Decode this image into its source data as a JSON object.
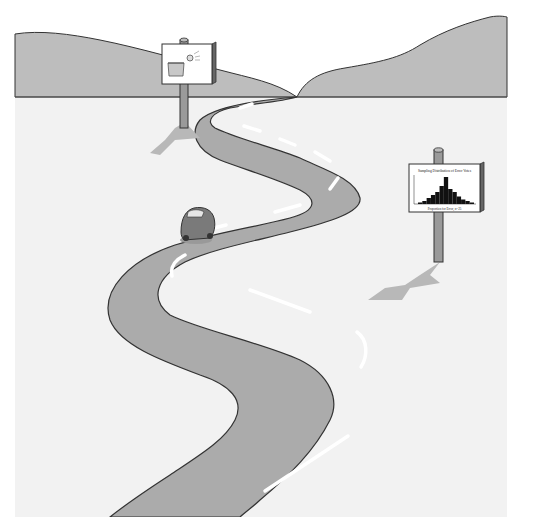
{
  "scene": {
    "description": "Winding road illustration with two signposts and a car",
    "colors": {
      "sky": "#ffffff",
      "hills": "#bdbdbd",
      "ground": "#f2f2f2",
      "road": "#ababab",
      "road_edge": "#333333",
      "lane_marks": "#ffffff",
      "shadow": "#b8b8b8",
      "post": "#9a9a9a",
      "car": "#7a7a7a"
    }
  },
  "sign_left": {
    "icon": "ball-into-basket-icon"
  },
  "sign_right": {
    "title": "Sampling Distribution of Error Votes",
    "xlabel": "Proportion for Error, n=25",
    "icon": "histogram-icon"
  },
  "chart_data": {
    "type": "bar",
    "title": "Sampling Distribution of Error Votes",
    "xlabel": "Proportion for Error, n=25",
    "ylabel": "",
    "categories": [
      "c1",
      "c2",
      "c3",
      "c4",
      "c5",
      "c6",
      "c7",
      "c8",
      "c9",
      "c10",
      "c11",
      "c12",
      "c13"
    ],
    "values": [
      1,
      2,
      4,
      6,
      8,
      12,
      18,
      10,
      8,
      5,
      3,
      2,
      1
    ]
  }
}
